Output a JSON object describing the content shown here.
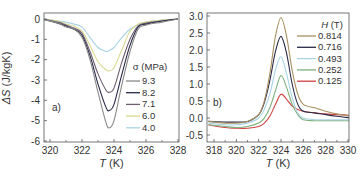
{
  "chart_data": [
    {
      "type": "line",
      "panel_label": "a)",
      "xlabel": "T (K)",
      "ylabel": "ΔS (J/kgK)",
      "xlim": [
        319.5,
        328
      ],
      "ylim": [
        -6,
        0.3
      ],
      "xticks": [
        "320",
        "322",
        "324",
        "326",
        "328"
      ],
      "yticks": [
        "0",
        "-1",
        "-2",
        "-3",
        "-4",
        "-5",
        "-6"
      ],
      "legend_title": "σ (MPa)",
      "legend_position": "right-center",
      "x": [
        319.5,
        320.5,
        321,
        321.5,
        322,
        322.5,
        323,
        323.5,
        323.7,
        324,
        324.5,
        325,
        325.5,
        326,
        327,
        328
      ],
      "series": [
        {
          "name": "9.3",
          "color": "#8a8a8a",
          "values": [
            0,
            -0.2,
            -0.4,
            -0.5,
            -0.9,
            -2.0,
            -3.6,
            -5.1,
            -5.35,
            -5.0,
            -3.2,
            -1.6,
            -0.5,
            -0.3,
            -0.15,
            0
          ]
        },
        {
          "name": "8.2",
          "color": "#2a2a4a",
          "values": [
            0,
            -0.2,
            -0.35,
            -0.5,
            -0.8,
            -1.8,
            -3.2,
            -4.35,
            -4.5,
            -4.2,
            -2.7,
            -1.3,
            -0.4,
            -0.25,
            -0.1,
            0
          ]
        },
        {
          "name": "7.1",
          "color": "#6e5e6e",
          "values": [
            0,
            -0.15,
            -0.3,
            -0.45,
            -0.7,
            -1.6,
            -2.7,
            -3.5,
            -3.6,
            -3.4,
            -2.1,
            -1.0,
            -0.35,
            -0.2,
            -0.1,
            0
          ]
        },
        {
          "name": "6.0",
          "color": "#d8d890",
          "values": [
            0,
            -0.1,
            -0.25,
            -0.35,
            -0.6,
            -1.3,
            -2.1,
            -2.5,
            -2.55,
            -2.4,
            -1.5,
            -0.6,
            -0.25,
            -0.15,
            -0.05,
            0
          ]
        },
        {
          "name": "4.0",
          "color": "#a8d4e4",
          "values": [
            0,
            -0.1,
            -0.15,
            -0.25,
            -0.4,
            -0.9,
            -1.4,
            -1.6,
            -1.55,
            -1.4,
            -0.9,
            -0.5,
            -0.3,
            -0.15,
            -0.05,
            0
          ]
        }
      ]
    },
    {
      "type": "line",
      "panel_label": "b)",
      "xlabel": "T (K)",
      "ylabel": "",
      "xlim": [
        317.5,
        330.3
      ],
      "ylim": [
        -0.6,
        3.1
      ],
      "xticks": [
        "318",
        "320",
        "322",
        "324",
        "326",
        "328",
        "330"
      ],
      "yticks": [
        "3.0",
        "2.5",
        "2.0",
        "1.5",
        "1.0",
        "0.5",
        "0.0",
        "-0.5"
      ],
      "legend_title": "H (T)",
      "legend_position": "upper-right",
      "x": [
        317.5,
        319,
        320,
        321,
        322,
        322.5,
        323,
        323.5,
        324,
        324.5,
        325,
        325.5,
        326,
        327,
        328,
        329,
        330.3
      ],
      "series": [
        {
          "name": "0.814",
          "color": "#a89060",
          "values": [
            -0.1,
            -0.15,
            -0.15,
            -0.1,
            0.1,
            0.5,
            1.3,
            2.4,
            2.95,
            2.4,
            1.4,
            0.7,
            0.4,
            0.3,
            0.2,
            0.12,
            0.05
          ]
        },
        {
          "name": "0.716",
          "color": "#2a2a4a",
          "values": [
            -0.1,
            -0.12,
            -0.12,
            -0.1,
            0.1,
            0.45,
            1.1,
            1.95,
            2.4,
            1.9,
            1.0,
            0.4,
            0.2,
            0.15,
            0.1,
            0.05,
            0.0
          ]
        },
        {
          "name": "0.493",
          "color": "#a8d4e4",
          "values": [
            -0.15,
            -0.2,
            -0.2,
            -0.15,
            0.0,
            0.25,
            0.7,
            1.4,
            1.8,
            1.3,
            0.6,
            0.15,
            0.0,
            -0.05,
            -0.05,
            -0.05,
            -0.05
          ]
        },
        {
          "name": "0.252",
          "color": "#7cb07c",
          "values": [
            -0.2,
            -0.25,
            -0.28,
            -0.25,
            -0.15,
            0.0,
            0.3,
            0.8,
            1.25,
            0.9,
            0.4,
            0.1,
            -0.05,
            -0.08,
            -0.08,
            -0.08,
            -0.08
          ]
        },
        {
          "name": "0.125",
          "color": "#d04040",
          "values": [
            -0.2,
            -0.28,
            -0.3,
            -0.3,
            -0.25,
            -0.15,
            0.05,
            0.4,
            0.7,
            0.55,
            0.35,
            0.25,
            0.2,
            0.15,
            0.12,
            0.1,
            0.08
          ]
        }
      ]
    }
  ]
}
